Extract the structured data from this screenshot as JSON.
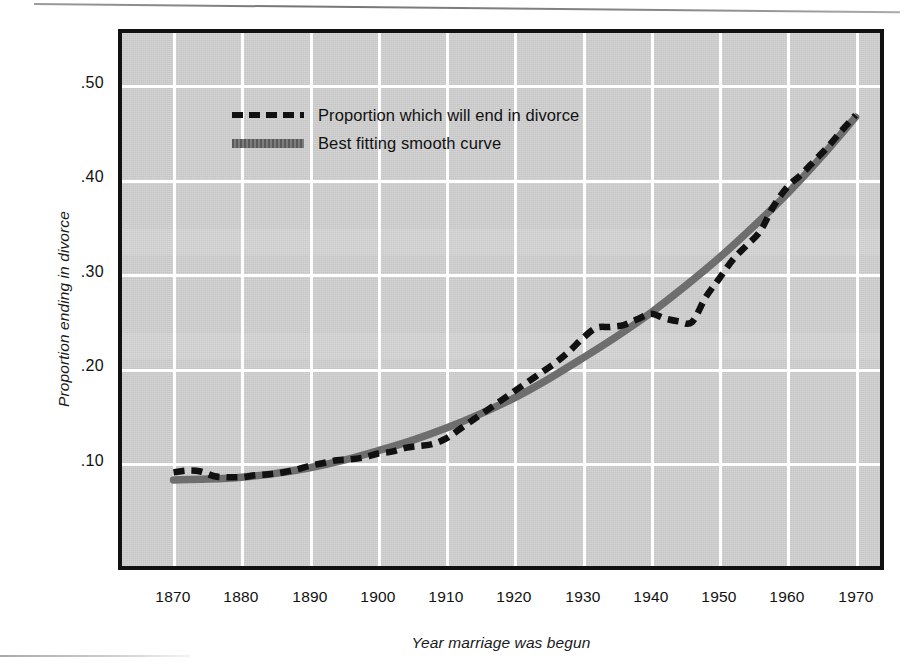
{
  "figure": {
    "background_color": "#cfcfcf",
    "frame_color": "#111111",
    "grid_color": "#ffffff"
  },
  "axes": {
    "ylabel": "Proportion ending in divorce",
    "xlabel": "Year marriage was begun",
    "yticks": [
      ".50",
      ".40",
      ".30",
      ".20",
      ".10"
    ],
    "xticks": [
      "1870",
      "1880",
      "1890",
      "1900",
      "1910",
      "1920",
      "1930",
      "1940",
      "1950",
      "1960",
      "1970"
    ]
  },
  "legend": {
    "items": [
      {
        "label": "Proportion which will end in divorce",
        "style": "dashed",
        "color": "#111111"
      },
      {
        "label": "Best fitting smooth curve",
        "style": "solid",
        "color": "#6e6e6e"
      }
    ]
  },
  "chart_data": {
    "type": "line",
    "title": "",
    "xlabel": "Year marriage was begun",
    "ylabel": "Proportion ending in divorce",
    "xlim": [
      1868,
      1972
    ],
    "ylim": [
      0.0,
      0.56
    ],
    "xticks": [
      1870,
      1880,
      1890,
      1900,
      1910,
      1920,
      1930,
      1940,
      1950,
      1960,
      1970
    ],
    "yticks": [
      0.1,
      0.2,
      0.3,
      0.4,
      0.5
    ],
    "grid": true,
    "legend_position": "upper-left-inside",
    "series": [
      {
        "name": "Proportion which will end in divorce",
        "style": "dashed",
        "color": "#111111",
        "x": [
          1870,
          1872,
          1874,
          1876,
          1878,
          1880,
          1882,
          1884,
          1886,
          1888,
          1890,
          1892,
          1894,
          1896,
          1898,
          1900,
          1902,
          1904,
          1906,
          1908,
          1910,
          1912,
          1914,
          1916,
          1918,
          1920,
          1922,
          1924,
          1926,
          1928,
          1930,
          1932,
          1934,
          1936,
          1938,
          1940,
          1942,
          1944,
          1946,
          1948,
          1950,
          1952,
          1954,
          1956,
          1958,
          1960,
          1962,
          1964,
          1966,
          1968,
          1970
        ],
        "y": [
          0.09,
          0.092,
          0.091,
          0.086,
          0.085,
          0.085,
          0.087,
          0.088,
          0.09,
          0.093,
          0.097,
          0.1,
          0.103,
          0.104,
          0.106,
          0.11,
          0.112,
          0.116,
          0.118,
          0.12,
          0.126,
          0.136,
          0.146,
          0.156,
          0.166,
          0.176,
          0.186,
          0.196,
          0.206,
          0.218,
          0.232,
          0.243,
          0.244,
          0.246,
          0.252,
          0.258,
          0.253,
          0.25,
          0.249,
          0.275,
          0.295,
          0.315,
          0.33,
          0.345,
          0.372,
          0.392,
          0.405,
          0.42,
          0.435,
          0.452,
          0.468
        ]
      },
      {
        "name": "Best fitting smooth curve",
        "style": "solid",
        "color": "#6e6e6e",
        "x": [
          1870,
          1875,
          1880,
          1885,
          1890,
          1895,
          1900,
          1905,
          1910,
          1915,
          1920,
          1925,
          1930,
          1935,
          1940,
          1945,
          1950,
          1955,
          1960,
          1965,
          1970
        ],
        "y": [
          0.082,
          0.083,
          0.085,
          0.089,
          0.095,
          0.103,
          0.113,
          0.124,
          0.137,
          0.152,
          0.169,
          0.189,
          0.211,
          0.234,
          0.259,
          0.287,
          0.317,
          0.35,
          0.385,
          0.424,
          0.466
        ]
      }
    ],
    "annotations": [
      {
        "text": "plateau / dip around WWII-era marriages (1940-1946) near .25"
      },
      {
        "text": "observed series ends near .47 for marriages begun about 1970"
      }
    ]
  }
}
